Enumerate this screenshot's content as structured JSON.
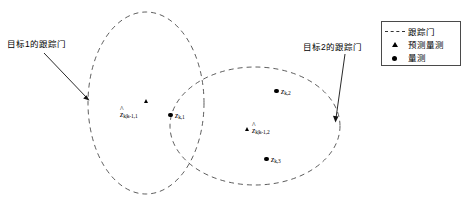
{
  "figure": {
    "title": "",
    "background": "#ffffff",
    "width": 466,
    "height": 203
  },
  "annotations": [
    {
      "id": "target1",
      "text": "目标1的跟踪门"
    },
    {
      "id": "target2",
      "text": "目标2的跟踪门"
    }
  ],
  "legend": {
    "items": [
      {
        "key": "dashed-line",
        "label": "跟踪门"
      },
      {
        "key": "triangle",
        "label": "预测量测"
      },
      {
        "key": "dot",
        "label": "量测"
      }
    ]
  },
  "gates": [
    {
      "id": "gate1",
      "name": "目标1的跟踪门",
      "cx": 146,
      "cy": 103,
      "rx": 58,
      "ry": 91,
      "style": "dashed"
    },
    {
      "id": "gate2",
      "name": "目标2的跟踪门",
      "cx": 255,
      "cy": 126,
      "rx": 85,
      "ry": 59,
      "style": "dashed"
    }
  ],
  "points": [
    {
      "id": "pred-1",
      "marker": "triangle",
      "label_hat": "^",
      "label_base": "z",
      "label_sub": "k|k-1,1",
      "x": 147,
      "y": 101
    },
    {
      "id": "meas-k1",
      "marker": "dot",
      "label_hat": "",
      "label_base": "z",
      "label_sub": "k,1",
      "x": 170,
      "y": 115
    },
    {
      "id": "meas-k2",
      "marker": "dot",
      "label_hat": "",
      "label_base": "z",
      "label_sub": "k,2",
      "x": 276,
      "y": 91
    },
    {
      "id": "pred-2",
      "marker": "triangle",
      "label_hat": "^",
      "label_base": "z",
      "label_sub": "k|k-1,2",
      "x": 248,
      "y": 129
    },
    {
      "id": "meas-k3",
      "marker": "dot",
      "label_hat": "",
      "label_base": "z",
      "label_sub": "k,3",
      "x": 266,
      "y": 159
    }
  ],
  "colors": {
    "line": "#333333",
    "marker": "#000000",
    "text": "#000000",
    "legend_border": "#4a4a4a"
  }
}
